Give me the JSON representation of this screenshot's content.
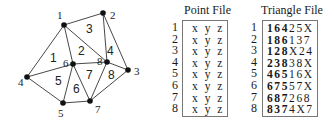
{
  "mesh": {
    "nodes": [
      {
        "id": "1",
        "x": 64,
        "y": 25,
        "lx": 57,
        "ly": 19
      },
      {
        "id": "2",
        "x": 103,
        "y": 13,
        "lx": 110,
        "ly": 19
      },
      {
        "id": "3",
        "x": 128,
        "y": 70,
        "lx": 134,
        "ly": 75
      },
      {
        "id": "4",
        "x": 27,
        "y": 77,
        "lx": 18,
        "ly": 86
      },
      {
        "id": "5",
        "x": 63,
        "y": 103,
        "lx": 58,
        "ly": 117
      },
      {
        "id": "6",
        "x": 73,
        "y": 64,
        "lx": 63,
        "ly": 67
      },
      {
        "id": "7",
        "x": 90,
        "y": 101,
        "lx": 95,
        "ly": 113
      },
      {
        "id": "8",
        "x": 107,
        "y": 62,
        "lx": 97,
        "ly": 65
      }
    ],
    "triangles": [
      {
        "id": "1",
        "lx": 50,
        "ly": 62
      },
      {
        "id": "2",
        "lx": 78,
        "ly": 55
      },
      {
        "id": "3",
        "lx": 86,
        "ly": 33
      },
      {
        "id": "4",
        "lx": 107,
        "ly": 55
      },
      {
        "id": "5",
        "lx": 55,
        "ly": 85
      },
      {
        "id": "6",
        "lx": 73,
        "ly": 93
      },
      {
        "id": "7",
        "lx": 86,
        "ly": 79
      },
      {
        "id": "8",
        "lx": 108,
        "ly": 79
      }
    ],
    "edges": [
      [
        "1",
        "2"
      ],
      [
        "1",
        "4"
      ],
      [
        "1",
        "6"
      ],
      [
        "1",
        "8"
      ],
      [
        "2",
        "8"
      ],
      [
        "2",
        "3"
      ],
      [
        "3",
        "8"
      ],
      [
        "3",
        "7"
      ],
      [
        "4",
        "6"
      ],
      [
        "4",
        "5"
      ],
      [
        "5",
        "6"
      ],
      [
        "5",
        "7"
      ],
      [
        "6",
        "7"
      ],
      [
        "6",
        "8"
      ],
      [
        "7",
        "8"
      ]
    ]
  },
  "point_file": {
    "title": "Point File",
    "row_numbers": [
      "1",
      "2",
      "3",
      "4",
      "5",
      "6",
      "7",
      "8"
    ],
    "rows": [
      "x y z",
      "x y z",
      "x y z",
      "x y z",
      "x y z",
      "x y z",
      "x y z",
      "x y z"
    ]
  },
  "triangle_file": {
    "title": "Triangle File",
    "row_numbers": [
      "1",
      "2",
      "3",
      "4",
      "5",
      "6",
      "7",
      "8"
    ],
    "rows": [
      {
        "vertices": "164",
        "neighbors": "25X"
      },
      {
        "vertices": "186",
        "neighbors": "137"
      },
      {
        "vertices": "128",
        "neighbors": "X24"
      },
      {
        "vertices": "238",
        "neighbors": "38X"
      },
      {
        "vertices": "465",
        "neighbors": "16X"
      },
      {
        "vertices": "675",
        "neighbors": "57X"
      },
      {
        "vertices": "687",
        "neighbors": "268"
      },
      {
        "vertices": "837",
        "neighbors": "4X7"
      }
    ]
  }
}
